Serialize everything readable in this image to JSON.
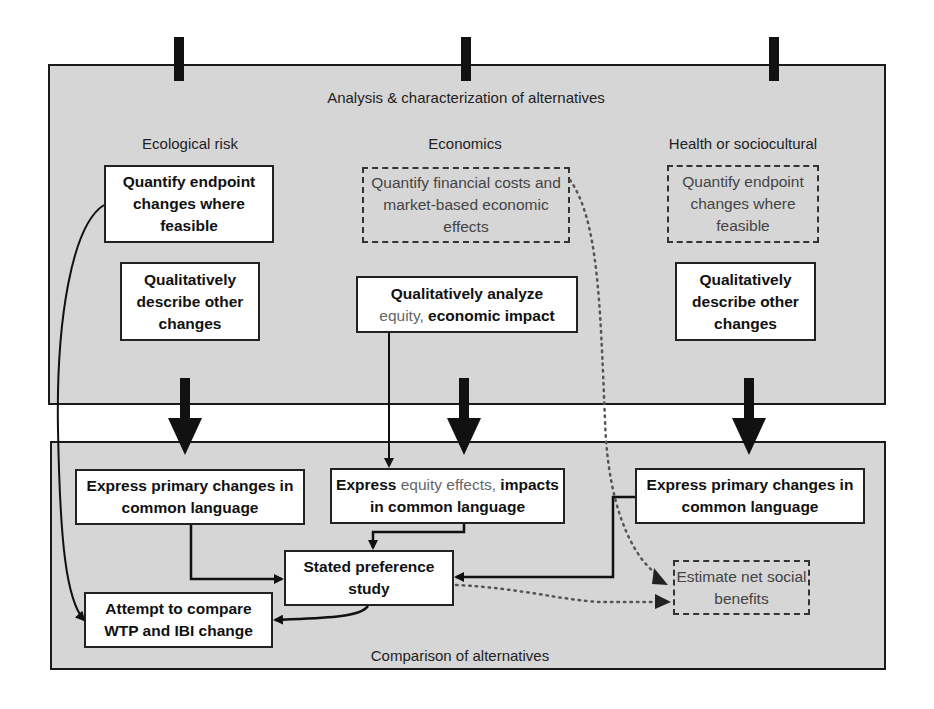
{
  "top_panel": {
    "title": "Analysis & characterization of alternatives",
    "columns": [
      {
        "heading": "Ecological risk",
        "quantify": {
          "text": "Quantify endpoint changes where feasible",
          "style": "solid"
        },
        "qualitative": {
          "text": "Qualitatively describe other changes",
          "style": "solid"
        }
      },
      {
        "heading": "Economics",
        "quantify": {
          "text": "Quantify financial costs and market-based economic effects",
          "style": "dashed"
        },
        "qualitative": {
          "line1": "Qualitatively analyze",
          "line2_light": "equity,",
          "line2_bold": "economic impact",
          "style": "solid"
        }
      },
      {
        "heading": "Health or sociocultural",
        "quantify": {
          "text": "Quantify endpoint changes where feasible",
          "style": "dashed"
        },
        "qualitative": {
          "text": "Qualitatively describe other changes",
          "style": "solid"
        }
      }
    ]
  },
  "bottom_panel": {
    "title": "Comparison of alternatives",
    "express_left": "Express primary changes in common language",
    "express_middle": {
      "bold1": "Express",
      "light": "equity effects,",
      "bold2": "impacts",
      "line2": "in common language"
    },
    "express_right": "Express primary changes in common language",
    "stated_preference": "Stated preference study",
    "compare": "Attempt to compare WTP and IBI change",
    "net_benefits": "Estimate net social benefits"
  },
  "colors": {
    "panel_fill": "#d6d6d6",
    "box_fill": "#ffffff",
    "stroke": "#1a1a1a"
  }
}
